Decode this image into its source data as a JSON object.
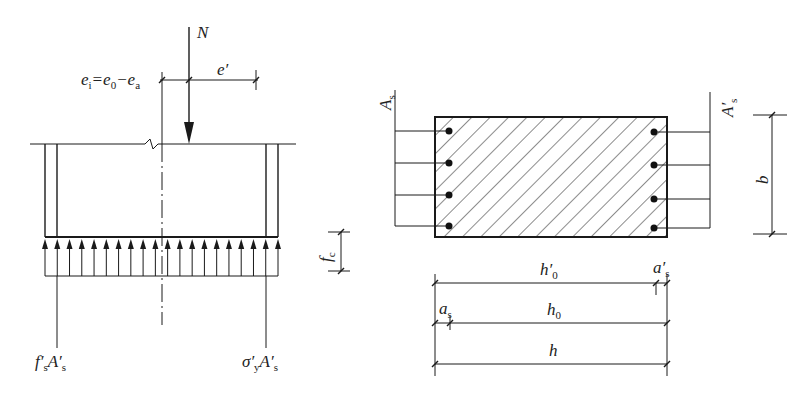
{
  "left_diagram": {
    "title": "eccentric tension member stress diagram",
    "load": {
      "label": "N"
    },
    "eccentricity": {
      "label_main": "e",
      "label_sub": "i",
      "formula_rest": "=e",
      "sub0": "0",
      "minus": "−e",
      "suba": "a",
      "e_prime": "e′"
    },
    "stress_block": {
      "arrow_count": 20,
      "label": "f",
      "label_sub": "c"
    },
    "left_force": {
      "f": "f′",
      "f_sub": "s",
      "A": "A′",
      "A_sub": "s"
    },
    "right_force": {
      "sigma": "σ′",
      "sigma_sub": "y",
      "A": "A′",
      "A_sub": "s"
    }
  },
  "right_diagram": {
    "title": "rectangular cross-section",
    "left_steel": {
      "label": "A",
      "sub": "s",
      "bar_count": 4
    },
    "right_steel": {
      "label": "A′",
      "sub": "s",
      "bar_count": 4
    },
    "width_dim": {
      "label": "b"
    },
    "dims": {
      "h0_prime": {
        "label": "h′",
        "sub": "0"
      },
      "as_prime": {
        "label": "a′",
        "sub": "s"
      },
      "as": {
        "label": "a",
        "sub": "s"
      },
      "h0": {
        "label": "h",
        "sub": "0"
      },
      "h": {
        "label": "h"
      }
    }
  },
  "colors": {
    "line": "#1a1a1a",
    "background": "#ffffff"
  }
}
